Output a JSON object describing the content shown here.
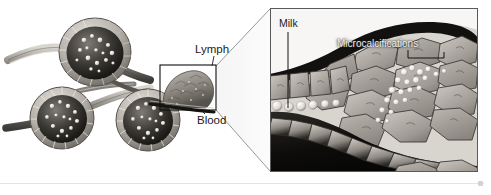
{
  "figure": {
    "panels": {
      "left": {
        "name": "lobule-overview",
        "description": "Cutaway drawing of three breast lobules (acini) lined by epithelial cells and filled with milk droplets, joined by ducts",
        "labels": [
          {
            "id": "lymph",
            "text": "Lymph"
          },
          {
            "id": "blood",
            "text": "Blood"
          }
        ],
        "callout_box": {
          "x": 160,
          "y": 65,
          "width": 56,
          "height": 45
        }
      },
      "right": {
        "name": "magnified-duct-detail",
        "description": "Magnified cross-section of a duct showing milk droplets and a cluster of microcalcifications among polygonal tumour cells",
        "labels": [
          {
            "id": "milk",
            "text": "Milk"
          },
          {
            "id": "microcalcifications",
            "text": "Microcalcifications"
          }
        ],
        "frame": {
          "x": 270,
          "y": 8,
          "width": 208,
          "height": 164
        }
      }
    }
  },
  "colors": {
    "ink": "#1b1b1b",
    "frame": "#3a3a3a",
    "callout": "#111111",
    "tissue_light": "#cfcbc6",
    "tissue_mid": "#9b9691",
    "tissue_dark": "#4a4744",
    "lumen_dark": "#14120f",
    "calcification": "#f4f2ee",
    "divider": "#e3e3e3",
    "background": "#ffffff"
  },
  "divider": {
    "label": "page-rule",
    "endcap_label": "rule-endcap"
  }
}
